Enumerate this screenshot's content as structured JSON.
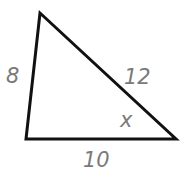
{
  "diagram": {
    "type": "triangle",
    "vertices": {
      "top": [
        40,
        13
      ],
      "bottom_left": [
        26,
        139
      ],
      "bottom_right": [
        176,
        139
      ]
    },
    "stroke_color": "#111111",
    "label_color": "#7a7a7a",
    "labels": {
      "left_side": "8",
      "hypotenuse_side": "12",
      "bottom_side": "10",
      "angle": "x"
    }
  }
}
